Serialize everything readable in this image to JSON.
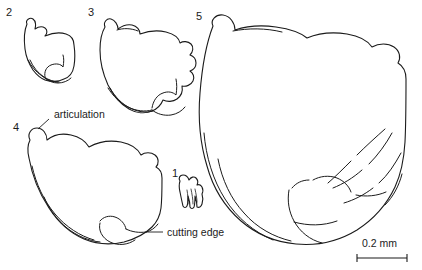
{
  "figure": {
    "type": "scientific-line-drawing",
    "background_color": "#ffffff",
    "line_color": "#1b1b1b",
    "width": 422,
    "height": 270
  },
  "specimens": [
    {
      "number": "1",
      "label_x": 172,
      "label_y": 177,
      "description": "smallest denticulate element"
    },
    {
      "number": "2",
      "label_x": 6,
      "label_y": 16,
      "description": "small outline element"
    },
    {
      "number": "3",
      "label_x": 88,
      "label_y": 16,
      "description": "medium outline element"
    },
    {
      "number": "4",
      "label_x": 13,
      "label_y": 131,
      "description": "large outline element, lower left"
    },
    {
      "number": "5",
      "label_x": 196,
      "label_y": 20,
      "description": "largest outline element, right"
    }
  ],
  "callouts": [
    {
      "text": "articulation",
      "text_x": 54,
      "text_y": 118
    },
    {
      "text": "cutting edge",
      "text_x": 167,
      "text_y": 236
    }
  ],
  "scale_bar": {
    "label": "0.2 mm",
    "label_x": 362,
    "label_y": 247,
    "bar_x1": 357,
    "bar_x2": 407,
    "bar_y": 258
  }
}
